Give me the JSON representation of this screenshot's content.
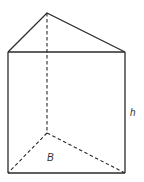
{
  "diagram": {
    "type": "triangular-prism",
    "labels": {
      "height": "h",
      "base": "B"
    },
    "vertices": {
      "apex_top": [
        47,
        13
      ],
      "front_top_left": [
        8,
        52
      ],
      "front_top_right": [
        125,
        52
      ],
      "back_bottom": [
        47,
        133
      ],
      "front_bottom_left": [
        8,
        173
      ],
      "front_bottom_right": [
        125,
        173
      ]
    },
    "colors": {
      "stroke": "#2a2a2a",
      "background": "#ffffff"
    }
  }
}
